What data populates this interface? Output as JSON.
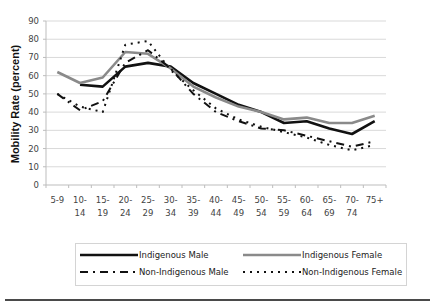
{
  "chart_data": {
    "type": "line",
    "title": "",
    "xlabel": "",
    "ylabel": "Mobility Rate (percent)",
    "ylim": [
      0,
      90
    ],
    "yticks": [
      0,
      10,
      20,
      30,
      40,
      50,
      60,
      70,
      80,
      90
    ],
    "grid": true,
    "legend_position": "bottom",
    "categories": [
      "5-9",
      "10-14",
      "15-19",
      "20-24",
      "25-29",
      "30-34",
      "35-39",
      "40-44",
      "45-49",
      "50-54",
      "55-59",
      "60-64",
      "65-69",
      "70-74",
      "75+"
    ],
    "category_lines": [
      [
        "5-9"
      ],
      [
        "10-",
        "14"
      ],
      [
        "15-",
        "19"
      ],
      [
        "20-",
        "24"
      ],
      [
        "25-",
        "29"
      ],
      [
        "30-",
        "34"
      ],
      [
        "35-",
        "39"
      ],
      [
        "40-",
        "44"
      ],
      [
        "45-",
        "49"
      ],
      [
        "50-",
        "54"
      ],
      [
        "55-",
        "59"
      ],
      [
        "60-",
        "64"
      ],
      [
        "65-",
        "69"
      ],
      [
        "70-",
        "74"
      ],
      [
        "75+"
      ]
    ],
    "series": [
      {
        "name": "Indigenous Male",
        "style": "solid",
        "color": "#111111",
        "width": 2.6,
        "values": [
          null,
          55,
          54,
          65,
          67,
          65,
          56,
          50,
          44,
          40,
          34,
          35,
          31,
          28,
          35
        ]
      },
      {
        "name": "Indigenous Female",
        "style": "solid",
        "color": "#8a8a8a",
        "width": 2.6,
        "values": [
          62,
          56,
          59,
          73,
          72,
          64,
          54,
          48,
          43,
          40,
          36,
          37,
          34,
          34,
          38
        ]
      },
      {
        "name": "Non-Indigenous Male",
        "style": "dashdot",
        "color": "#111111",
        "width": 2.0,
        "values": [
          50,
          41,
          46,
          67,
          74,
          64,
          50,
          40,
          35,
          31,
          30,
          27,
          24,
          21,
          24
        ]
      },
      {
        "name": "Non-Indigenous Female",
        "style": "dotted",
        "color": "#111111",
        "width": 2.0,
        "values": [
          50,
          43,
          40,
          77,
          79,
          63,
          52,
          42,
          36,
          32,
          29,
          26,
          22,
          19,
          22
        ]
      }
    ]
  },
  "legend": {
    "items": [
      {
        "label": "Indigenous Male"
      },
      {
        "label": "Indigenous Female"
      },
      {
        "label": "Non-Indigenous Male"
      },
      {
        "label": "Non-Indigenous Female"
      }
    ]
  }
}
